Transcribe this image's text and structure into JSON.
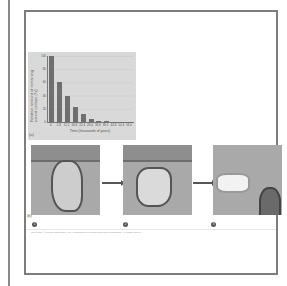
{
  "figure": {
    "panel_a_label": "(a)",
    "panel_b_label": "(b)",
    "faint_header_text": "",
    "caption": "Copyright © Pearson Education, Inc., publishing as Pearson Benjamin Cummings. All rights reserved.",
    "steps": [
      "1",
      "2",
      "3"
    ],
    "colors": {
      "frame_border": "#7d7d7d",
      "chart_background": "#d9d9d9",
      "bar": "#6f6f6f",
      "photo_background": "#a9a9a9"
    }
  },
  "chart_data": {
    "type": "bar",
    "title": "",
    "xlabel": "Time (thousands of years)",
    "ylabel": "Relative amount of remaining parent isotope (%)",
    "categories": [
      "0",
      "5.8",
      "11.2",
      "16.8",
      "22.4",
      "28.0",
      "33.6",
      "39.2",
      "44.8",
      "50.4",
      "56.0"
    ],
    "values": [
      100,
      60,
      40,
      22,
      12,
      4,
      2,
      1,
      0.5,
      0.3,
      0.1
    ],
    "yticks": [
      "0",
      "20",
      "40",
      "60",
      "80",
      "100"
    ],
    "ylim": [
      0,
      100
    ],
    "grid": true,
    "legend": null
  }
}
